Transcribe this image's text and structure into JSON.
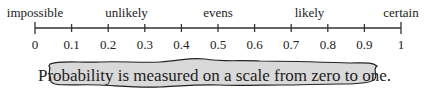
{
  "scale": {
    "labels": [
      {
        "text": "impossible",
        "value": 0
      },
      {
        "text": "unlikely",
        "value": 0.25
      },
      {
        "text": "evens",
        "value": 0.5
      },
      {
        "text": "likely",
        "value": 0.75
      },
      {
        "text": "certain",
        "value": 1
      }
    ],
    "ticks": [
      "0",
      "0.1",
      "0.2",
      "0.3",
      "0.4",
      "0.5",
      "0.6",
      "0.7",
      "0.8",
      "0.9",
      "1"
    ]
  },
  "caption": "Probability is measured on a scale from zero to one.",
  "colors": {
    "line": "#333333",
    "bubble_fill": "#d9d9d9",
    "bubble_stroke": "#222222"
  }
}
